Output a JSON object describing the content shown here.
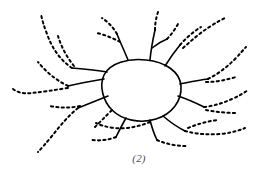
{
  "figure": {
    "caption": "(2)",
    "title": "",
    "background_color": "#ffffff",
    "stroke_color": "#000000",
    "width": 278,
    "height": 182,
    "style": {
      "core_stroke_width": 1.6,
      "branch_stroke_width": 2.0,
      "dot_dash_pattern": "2.2 3.2",
      "dot_linecap": "round"
    }
  },
  "chart_data": {
    "type": "line",
    "title": "(2)",
    "subtitle": "",
    "xlabel": "",
    "ylabel": "",
    "grid": false,
    "legend": "none",
    "xlim": [
      0,
      278
    ],
    "ylim": [
      0,
      182
    ],
    "core_loop": {
      "name": "central-loop",
      "style": "solid",
      "path": "M 104 75 C 110 63, 128 58, 146 60 C 166 62, 180 72, 181 86 C 182 101, 172 114, 156 119 C 140 124, 122 120, 112 110 C 103 101, 99 86, 104 75 Z"
    },
    "solid_stems": [
      {
        "name": "stem-upper-left",
        "path": "M 107 72 C 96 70, 84 69, 72 68"
      },
      {
        "name": "stem-left-mid",
        "path": "M 104 79 C 92 81, 80 83, 68 86"
      },
      {
        "name": "stem-left-low",
        "path": "M 108 96 C 98 100, 88 104, 78 108"
      },
      {
        "name": "stem-up-a",
        "path": "M 128 60 C 124 50, 120 42, 117 34"
      },
      {
        "name": "stem-up-b",
        "path": "M 150 60 C 151 49, 153 39, 155 30"
      },
      {
        "name": "stem-up-b-branch",
        "path": "M 152 48 C 157 44, 162 41, 167 39"
      },
      {
        "name": "stem-up-c",
        "path": "M 165 66 C 170 58, 175 51, 180 45"
      },
      {
        "name": "stem-right-a",
        "path": "M 180 84 C 190 82, 199 80, 208 79"
      },
      {
        "name": "stem-right-b",
        "path": "M 178 96 C 187 99, 196 103, 204 107"
      },
      {
        "name": "stem-low-right",
        "path": "M 163 116 C 170 122, 177 127, 185 131"
      },
      {
        "name": "stem-low-mid",
        "path": "M 150 120 C 152 128, 154 134, 157 140"
      },
      {
        "name": "stem-low-left",
        "path": "M 126 118 C 122 125, 119 131, 116 137"
      }
    ],
    "dotted_branches": [
      {
        "name": "branch-tl-long",
        "path": "M 72 68 C 60 60, 52 48, 47 34 C 44 26, 42 20, 41 14"
      },
      {
        "name": "branch-tl-upper",
        "path": "M 74 66 C 66 56, 61 46, 58 36"
      },
      {
        "name": "branch-l-mid-upper",
        "path": "M 68 86 C 56 80, 46 72, 38 62"
      },
      {
        "name": "branch-l-far",
        "path": "M 68 88 C 54 90, 42 92, 32 93 C 22 94, 16 92, 12 88"
      },
      {
        "name": "branch-l-low",
        "path": "M 78 108 C 68 116, 60 126, 52 136 C 46 143, 42 148, 38 152"
      },
      {
        "name": "branch-l-low2",
        "path": "M 80 106 C 70 108, 60 108, 50 106"
      },
      {
        "name": "branch-up-a-tip",
        "path": "M 117 34 C 113 27, 108 22, 102 18"
      },
      {
        "name": "branch-up-a2",
        "path": "M 120 42 C 113 38, 105 35, 97 33"
      },
      {
        "name": "branch-up-b-tip",
        "path": "M 155 30 C 155 24, 156 18, 158 12"
      },
      {
        "name": "branch-up-b-branch-t",
        "path": "M 167 39 C 172 34, 176 28, 179 22"
      },
      {
        "name": "branch-up-c-tip",
        "path": "M 180 45 C 186 38, 193 32, 201 27"
      },
      {
        "name": "branch-ur-long",
        "path": "M 183 48 C 192 40, 201 32, 211 26 C 217 22, 221 20, 225 18"
      },
      {
        "name": "branch-r-a-tip",
        "path": "M 208 79 C 218 74, 227 67, 235 59 C 240 54, 243 50, 246 47"
      },
      {
        "name": "branch-r-a2",
        "path": "M 206 82 C 216 82, 226 80, 236 77"
      },
      {
        "name": "branch-r-b-tip",
        "path": "M 204 107 C 214 106, 223 103, 232 99 C 239 96, 244 93, 248 90"
      },
      {
        "name": "branch-r-c",
        "path": "M 206 110 C 216 112, 226 113, 236 113"
      },
      {
        "name": "branch-lr-tip",
        "path": "M 185 131 C 196 134, 208 135, 220 134 C 230 133, 238 131, 245 128"
      },
      {
        "name": "branch-lr-2",
        "path": "M 188 128 C 198 124, 208 121, 218 120"
      },
      {
        "name": "branch-lm-tip",
        "path": "M 157 140 C 166 144, 176 146, 186 146"
      },
      {
        "name": "branch-ll-tip",
        "path": "M 116 137 C 108 140, 100 141, 92 140"
      },
      {
        "name": "branch-bottom-loop",
        "path": "M 112 110 C 104 118, 98 124, 94 128"
      },
      {
        "name": "branch-bottom-arc",
        "path": "M 150 122 C 138 127, 126 129, 114 128 C 106 127, 100 125, 96 123"
      }
    ]
  }
}
